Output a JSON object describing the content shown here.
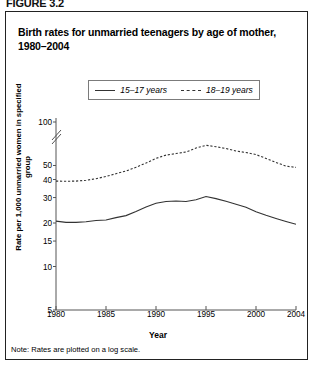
{
  "figure_caption": "FIGURE 3.2",
  "title": "Birth rates for unmarried teenagers by age of mother, 1980–2004",
  "note": "Note: Rates are plotted on a log scale.",
  "legend": {
    "items": [
      {
        "label": "15–17 years",
        "style": "solid"
      },
      {
        "label": "18–19 years",
        "style": "dashed"
      }
    ]
  },
  "chart_data": {
    "type": "line",
    "title": "Birth rates for unmarried teenagers by age of mother, 1980–2004",
    "xlabel": "Year",
    "ylabel": "Rate per 1,000 unmarried women in specified group",
    "yscale": "log",
    "ylim": [
      5,
      100
    ],
    "yticks": [
      5,
      10,
      15,
      20,
      30,
      40,
      50,
      100
    ],
    "axis_break": true,
    "xlim": [
      1980,
      2004
    ],
    "xticks": [
      1980,
      1985,
      1990,
      1995,
      2000,
      2004
    ],
    "grid": false,
    "legend_position": "top-center",
    "x": [
      1980,
      1981,
      1982,
      1983,
      1984,
      1985,
      1986,
      1987,
      1988,
      1989,
      1990,
      1991,
      1992,
      1993,
      1994,
      1995,
      1996,
      1997,
      1998,
      1999,
      2000,
      2001,
      2002,
      2003,
      2004
    ],
    "series": [
      {
        "name": "15–17 years",
        "style": "solid",
        "color": "#333333",
        "values": [
          20.6,
          20.2,
          20.2,
          20.4,
          20.8,
          21.0,
          21.8,
          22.5,
          24.0,
          25.8,
          27.4,
          28.2,
          28.4,
          28.2,
          29.0,
          30.5,
          29.5,
          28.3,
          27.0,
          25.7,
          23.9,
          22.6,
          21.5,
          20.5,
          19.6
        ]
      },
      {
        "name": "18–19 years",
        "style": "dashed",
        "color": "#333333",
        "values": [
          39.0,
          38.9,
          39.0,
          39.5,
          40.5,
          42.0,
          43.9,
          45.8,
          48.6,
          52.0,
          56.0,
          59.0,
          60.5,
          62.0,
          66.0,
          69.0,
          67.5,
          65.5,
          63.0,
          61.5,
          59.5,
          56.0,
          52.5,
          49.5,
          48.5
        ]
      }
    ]
  }
}
